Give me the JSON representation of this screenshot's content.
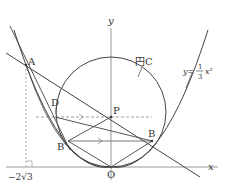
{
  "diagram": {
    "axes": {
      "x_label": "x",
      "y_label": "y",
      "origin_label": "O"
    },
    "points": {
      "A": "A",
      "B": "B",
      "B_prime": "B′",
      "D": "D",
      "P": "P",
      "O": "O"
    },
    "labels": {
      "circle": "円C",
      "curve_prefix": "y=",
      "curve_num": "1",
      "curve_den": "3",
      "curve_suffix": "x²",
      "x_tick": "−2√3"
    },
    "colors": {
      "stroke": "#444444",
      "axis": "#999999",
      "dashed": "#888888"
    }
  }
}
